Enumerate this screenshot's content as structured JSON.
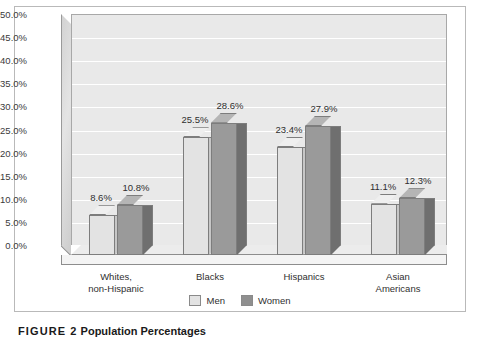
{
  "chart_data": {
    "type": "bar",
    "title": "",
    "xlabel": "",
    "ylabel": "",
    "categories": [
      "Whites,\nnon-Hispanic",
      "Blacks",
      "Hispanics",
      "Asian\nAmericans"
    ],
    "series": [
      {
        "name": "Men",
        "values": [
          8.6,
          25.5,
          23.4,
          11.1
        ],
        "labels": [
          "8.6%",
          "25.5%",
          "23.4%",
          "11.1%"
        ],
        "color": "#e3e3e3"
      },
      {
        "name": "Women",
        "values": [
          10.8,
          28.6,
          27.9,
          12.3
        ],
        "labels": [
          "10.8%",
          "28.6%",
          "27.9%",
          "12.3%"
        ],
        "color": "#9a9a9a"
      }
    ],
    "ylim": [
      0,
      50
    ],
    "ytick_step": 5,
    "ytick_labels": [
      "50.0%",
      "45.0%",
      "40.0%",
      "35.0%",
      "30.0%",
      "25.0%",
      "20.0%",
      "15.0%",
      "10.0%",
      "5.0%",
      "0.0%"
    ],
    "grid": true,
    "legend_position": "bottom",
    "style": "3d-column"
  },
  "legend": {
    "items": [
      {
        "label": "Men"
      },
      {
        "label": "Women"
      }
    ]
  },
  "caption": {
    "head": "FIGURE 2",
    "text": "Population Percentages"
  }
}
